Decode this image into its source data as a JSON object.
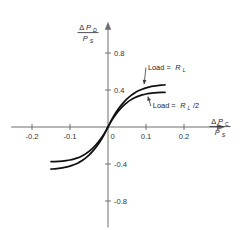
{
  "chart_data": {
    "type": "line",
    "title": "",
    "subtitle": "",
    "xlabel": "ΔP_C / P_S",
    "ylabel": "ΔP_D / P_S",
    "xlabel_parts": {
      "delta": "Δ",
      "num_main": "P",
      "num_sub": "C",
      "den_main": "P",
      "den_sub": "S"
    },
    "ylabel_parts": {
      "delta": "Δ",
      "num_main": "P",
      "num_sub": "D",
      "den_main": "P",
      "den_sub": "S"
    },
    "xlim": [
      -0.255,
      0.255
    ],
    "ylim": [
      -1.02,
      1.02
    ],
    "xticks": [
      -0.2,
      -0.1,
      0,
      0.1,
      0.2
    ],
    "xticklabels": [
      "-0.2",
      "-0.1",
      "0",
      "0.1",
      "0.2"
    ],
    "yticks": [
      0.8,
      0.4,
      -0.4,
      -0.8
    ],
    "yticklabels": [
      "0.8",
      "0.4",
      "-0.4",
      "-0.8"
    ],
    "grid": false,
    "legend_position": "inline-annotations",
    "axis_style": "centered-spines-with-arrows",
    "series": [
      {
        "name": "Load = R_L",
        "label_text": "Load =",
        "label_symbol": "R",
        "label_subscript": "L",
        "label_suffix": "",
        "x": [
          -0.15,
          -0.14,
          -0.13,
          -0.12,
          -0.11,
          -0.1,
          -0.09,
          -0.08,
          -0.07,
          -0.06,
          -0.05,
          -0.04,
          -0.03,
          -0.02,
          -0.01,
          0.0,
          0.01,
          0.02,
          0.03,
          0.04,
          0.05,
          0.06,
          0.07,
          0.08,
          0.09,
          0.1,
          0.11,
          0.12,
          0.13,
          0.14,
          0.15
        ],
        "y": [
          -0.375,
          -0.374,
          -0.372,
          -0.369,
          -0.364,
          -0.357,
          -0.347,
          -0.334,
          -0.316,
          -0.293,
          -0.264,
          -0.228,
          -0.185,
          -0.133,
          -0.072,
          0.0,
          0.072,
          0.133,
          0.185,
          0.228,
          0.264,
          0.293,
          0.316,
          0.334,
          0.347,
          0.357,
          0.364,
          0.369,
          0.372,
          0.374,
          0.375
        ]
      },
      {
        "name": "Load = R_L /2",
        "label_text": "Load =",
        "label_symbol": "R",
        "label_subscript": "L",
        "label_suffix": "/2",
        "x": [
          -0.15,
          -0.14,
          -0.13,
          -0.12,
          -0.11,
          -0.1,
          -0.09,
          -0.08,
          -0.07,
          -0.06,
          -0.05,
          -0.04,
          -0.03,
          -0.02,
          -0.01,
          0.0,
          0.01,
          0.02,
          0.03,
          0.04,
          0.05,
          0.06,
          0.07,
          0.08,
          0.09,
          0.1,
          0.11,
          0.12,
          0.13,
          0.14,
          0.15
        ],
        "y": [
          -0.455,
          -0.452,
          -0.448,
          -0.442,
          -0.434,
          -0.423,
          -0.409,
          -0.391,
          -0.368,
          -0.339,
          -0.303,
          -0.261,
          -0.211,
          -0.152,
          -0.082,
          0.0,
          0.082,
          0.152,
          0.211,
          0.261,
          0.303,
          0.339,
          0.368,
          0.391,
          0.409,
          0.423,
          0.434,
          0.442,
          0.448,
          0.452,
          0.455
        ]
      }
    ],
    "annotations": [
      {
        "name": "annotation-load-rl",
        "target_x": 0.095,
        "target_y": 0.463,
        "text_x": 0.105,
        "text_y": 0.62
      },
      {
        "name": "annotation-load-rl-half",
        "target_x": 0.105,
        "target_y": 0.33,
        "text_x": 0.118,
        "text_y": 0.205
      }
    ],
    "colors": {
      "curve": "#101010",
      "axis": "#6e6e6e",
      "text": "#23232a",
      "background": "#ffffff"
    }
  }
}
